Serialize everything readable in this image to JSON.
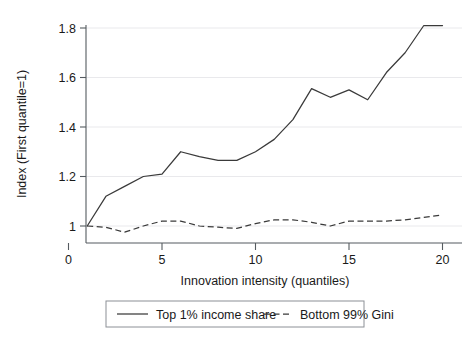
{
  "chart_data": {
    "type": "line",
    "title": "",
    "xlabel": "Innovation intensity (quantiles)",
    "ylabel": "Index (First quantile=1)",
    "xlim": [
      0,
      20.8
    ],
    "ylim": [
      0.93,
      1.87
    ],
    "xticks": [
      0,
      5,
      10,
      15,
      20
    ],
    "xticklabels": [
      "0",
      "5",
      "10",
      "15",
      "20"
    ],
    "yticks": [
      1,
      1.2,
      1.4,
      1.6,
      1.8
    ],
    "yticklabels": [
      "1",
      "1.2",
      "1.4",
      "1.6",
      "1.8"
    ],
    "grid": "horizontal-faint",
    "legend_position": "below-center",
    "x": [
      1,
      2,
      3,
      4,
      5,
      6,
      7,
      8,
      9,
      10,
      11,
      12,
      13,
      14,
      15,
      16,
      17,
      18,
      19,
      20
    ],
    "series": [
      {
        "name": "Top 1% income share",
        "style": "solid",
        "values": [
          1.0,
          1.12,
          1.16,
          1.2,
          1.21,
          1.3,
          1.28,
          1.265,
          1.265,
          1.3,
          1.35,
          1.43,
          1.555,
          1.52,
          1.55,
          1.51,
          1.62,
          1.7,
          1.81,
          1.81
        ]
      },
      {
        "name": "Bottom 99% Gini",
        "style": "dashed",
        "values": [
          1.0,
          0.995,
          0.975,
          1.0,
          1.02,
          1.02,
          1.0,
          0.995,
          0.99,
          1.01,
          1.025,
          1.025,
          1.015,
          1.0,
          1.02,
          1.02,
          1.02,
          1.025,
          1.035,
          1.045
        ]
      }
    ]
  },
  "legend": {
    "items": [
      {
        "label": "Top 1% income share",
        "style": "solid"
      },
      {
        "label": "Bottom 99% Gini",
        "style": "dashed"
      }
    ]
  }
}
